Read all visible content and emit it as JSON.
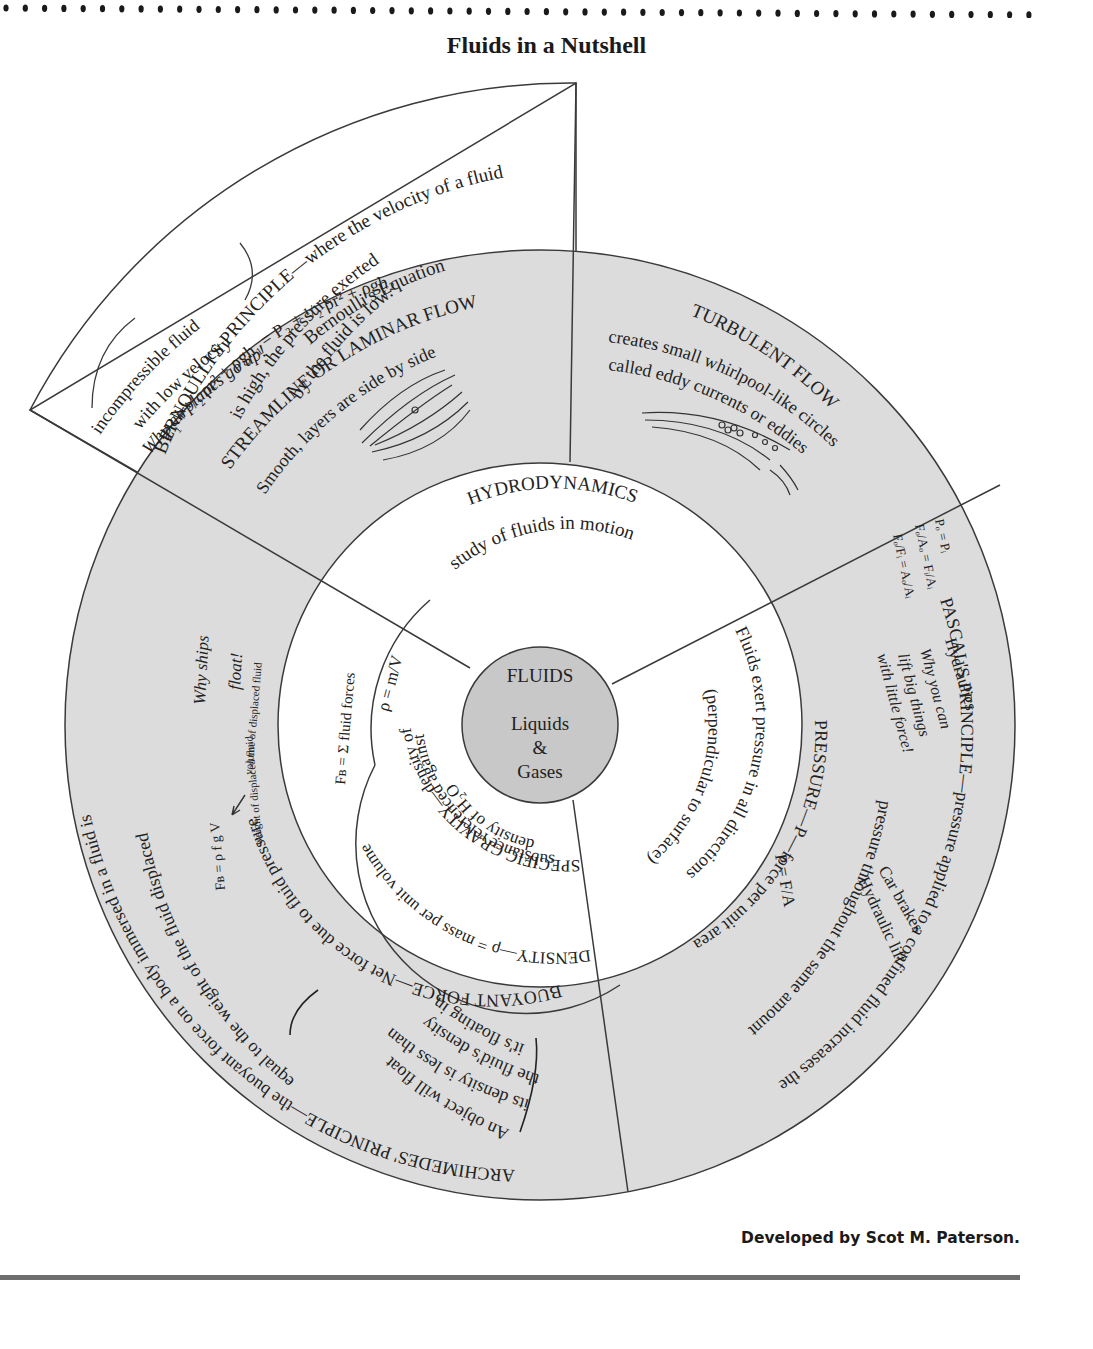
{
  "page": {
    "title": "Fluids in a Nutshell",
    "credit": "Developed by Scot M. Paterson."
  },
  "colors": {
    "ring_fill": "#dcdcdc",
    "core_fill": "#c8c8c8",
    "line": "#3a3a3a",
    "rule": "#6e6e6e",
    "paper": "#ffffff"
  },
  "center": {
    "title": "FLUIDS",
    "line1": "Liquids",
    "line2": "&",
    "line3": "Gases"
  },
  "hydrodynamics": {
    "title": "HYDRODYNAMICS",
    "subtitle": "study of fluids in motion"
  },
  "streamline": {
    "title": "STREAMLINE OR LAMINAR FLOW",
    "desc": "Smooth, layers are side by side"
  },
  "turbulent": {
    "title": "TURBULENT FLOW",
    "line1": "creates small whirlpool-like circles",
    "line2": "called eddy currents or eddies"
  },
  "bernoulli": {
    "title": "BERNOULLI'S PRINCIPLE—where the velocity of a fluid",
    "line2": "is high, the pressure exerted",
    "line3": "by the fluid is low.",
    "eq_title": "Bernoulli's Equation",
    "equation": "P₁ + ¹/₂ ρr² + ρgh₁ = P₂ + ¹/₂ ρr² + ρgh₂",
    "note1": "incompressible fluid",
    "note2": "with low velocity",
    "note3": "Why airplanes go up!"
  },
  "pascal": {
    "title": "PASCAL'S PRINCIPLE—pressure applied to a confined fluid increases the",
    "line2": "pressure throughout the same amount",
    "hydraulics": "Hydraulics",
    "why1": "Why you can",
    "why2": "lift big things",
    "why3": "with little force!",
    "ex1": "Car brakes",
    "ex2": "Hydraulic lift",
    "eq1": "Pₒ = Pᵢ",
    "eq2": "Fₒ/Aₒ = Fᵢ/Aᵢ",
    "eq3": "Fₒ/Fᵢ = Aₒ/Aᵢ"
  },
  "pressure": {
    "title": "PRESSURE—P—force per unit area",
    "formula": "P = F/A",
    "line2": "Fluids exert pressure in all directions",
    "line3": "(perpendicular to surface)"
  },
  "buoyant": {
    "title": "BUOYANT FORCE—Net force due to fluid pressure",
    "formula": "Fʙ = Σ fluid forces"
  },
  "density": {
    "title": "DENSITY—ρ = mass per unit volume",
    "formula": "ρ = m/V"
  },
  "specific_gravity": {
    "title": "SPECIFIC GRAVITY—density of",
    "line2": "substance referenced against",
    "line3": "density of H₂O"
  },
  "archimedes": {
    "title": "ARCHIMEDES' PRINCIPLE—the buoyant force on a body immersed in a fluid is",
    "line2": "equal to the weight of the fluid displaced",
    "why1": "Why ships",
    "why2": "float!",
    "formula": "Fʙ = ρ f g V",
    "label_weight": "weight of displaced fluid",
    "label_volume": "volume of displaced fluid",
    "note1": "An object will float if",
    "note2": "its density is less than",
    "note3": "the fluid's density",
    "note4": "it's floating in"
  }
}
